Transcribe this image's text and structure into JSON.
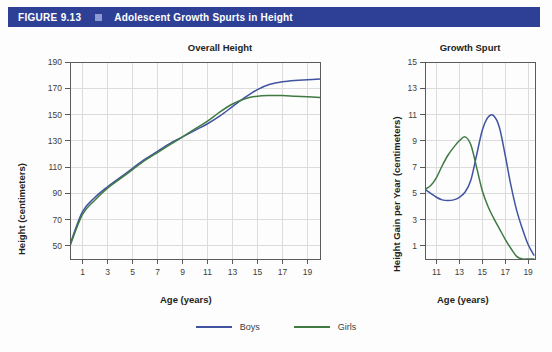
{
  "figure": {
    "number": "FIGURE 9.13",
    "title": "Adolescent Growth Spurts in Height",
    "header_color": "#2e4095",
    "marker_color": "#8d9ad4"
  },
  "series_colors": {
    "boys": "#4253a2",
    "girls": "#3f7a42"
  },
  "legend": {
    "items": [
      {
        "label": "Boys",
        "color": "#4253a2"
      },
      {
        "label": "Girls",
        "color": "#3f7a42"
      }
    ]
  },
  "chart_data": [
    {
      "type": "line",
      "id": "overall-height",
      "title": "Overall Height",
      "xlabel": "Age (years)",
      "ylabel": "Height (centimeters)",
      "xlim": [
        0,
        20
      ],
      "ylim": [
        40,
        190
      ],
      "xticks": [
        1,
        3,
        5,
        7,
        9,
        11,
        13,
        15,
        17,
        19
      ],
      "yticks": [
        50,
        70,
        90,
        110,
        130,
        150,
        170,
        190
      ],
      "grid": true,
      "legend_position": "bottom",
      "x": [
        0,
        1,
        2,
        3,
        4,
        5,
        6,
        7,
        8,
        9,
        10,
        11,
        12,
        13,
        14,
        15,
        16,
        17,
        18,
        19,
        20
      ],
      "series": [
        {
          "name": "Boys",
          "color": "#4253a2",
          "values": [
            51,
            76,
            87,
            95,
            102,
            109,
            116,
            122,
            128,
            133,
            138,
            143,
            149,
            156,
            163,
            169,
            173,
            175,
            176,
            176.5,
            177
          ]
        },
        {
          "name": "Girls",
          "color": "#3f7a42",
          "values": [
            50,
            74,
            85,
            94,
            101,
            108,
            115,
            121,
            127,
            133,
            139,
            145,
            152,
            158,
            162,
            164,
            164.5,
            164.5,
            164,
            163.5,
            163
          ]
        }
      ]
    },
    {
      "type": "line",
      "id": "growth-spurt",
      "title": "Growth Spurt",
      "xlabel": "Age (years)",
      "ylabel": "Height Gain per Year (centimeters)",
      "xlim": [
        10,
        19.6
      ],
      "ylim": [
        0,
        15
      ],
      "xticks": [
        11,
        13,
        15,
        17,
        19
      ],
      "yticks": [
        1,
        3,
        5,
        7,
        9,
        11,
        13,
        15
      ],
      "grid": true,
      "legend_position": "bottom",
      "x": [
        10,
        10.5,
        11,
        11.5,
        12,
        12.5,
        13,
        13.5,
        14,
        14.5,
        15,
        15.5,
        16,
        16.5,
        17,
        17.5,
        18,
        18.5,
        19,
        19.5
      ],
      "series": [
        {
          "name": "Boys",
          "color": "#4253a2",
          "values": [
            5.3,
            5.0,
            4.7,
            4.5,
            4.45,
            4.5,
            4.7,
            5.1,
            6.0,
            7.9,
            9.8,
            10.8,
            10.9,
            10.0,
            7.9,
            5.6,
            3.7,
            2.3,
            1.1,
            0.3
          ]
        },
        {
          "name": "Girls",
          "color": "#3f7a42",
          "values": [
            5.3,
            5.6,
            6.2,
            7.1,
            7.9,
            8.5,
            9.0,
            9.3,
            8.7,
            7.0,
            5.2,
            4.0,
            3.1,
            2.3,
            1.5,
            0.8,
            0.2,
            0,
            0,
            0
          ]
        }
      ]
    }
  ]
}
